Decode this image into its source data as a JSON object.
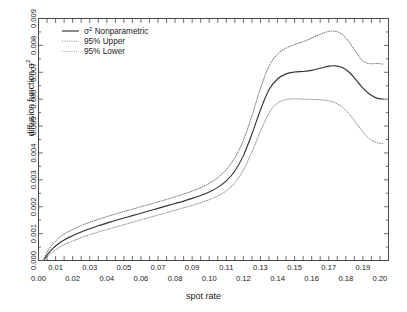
{
  "chart_data": {
    "type": "line",
    "title": "",
    "xlabel": "spot rate",
    "ylabel": "diffusion function σ²",
    "xlim": [
      0.0,
      0.205
    ],
    "ylim": [
      0.0,
      0.009
    ],
    "grid": false,
    "legend_position": "top-left",
    "x_ticklabels_upper": [
      "0.01",
      "0.03",
      "0.05",
      "0.07",
      "0.09",
      "0.11",
      "0.13",
      "0.15",
      "0.17",
      "0.19"
    ],
    "x_tickvalues_upper": [
      0.01,
      0.03,
      0.05,
      0.07,
      0.09,
      0.11,
      0.13,
      0.15,
      0.17,
      0.19
    ],
    "x_ticklabels_lower": [
      "0.00",
      "0.02",
      "0.04",
      "0.06",
      "0.08",
      "0.10",
      "0.12",
      "0.14",
      "0.16",
      "0.18",
      "0.20"
    ],
    "x_tickvalues_lower": [
      0.0,
      0.02,
      0.04,
      0.06,
      0.08,
      0.1,
      0.12,
      0.14,
      0.16,
      0.18,
      0.2
    ],
    "y_ticklabels": [
      "0.000",
      "0.001",
      "0.002",
      "0.003",
      "0.004",
      "0.005",
      "0.006",
      "0.007",
      "0.008",
      "0.009"
    ],
    "y_tickvalues": [
      0.0,
      0.001,
      0.002,
      0.003,
      0.004,
      0.005,
      0.006,
      0.007,
      0.008,
      0.009
    ],
    "x": [
      0.003,
      0.005,
      0.008,
      0.012,
      0.016,
      0.02,
      0.025,
      0.03,
      0.035,
      0.04,
      0.045,
      0.05,
      0.055,
      0.06,
      0.065,
      0.07,
      0.075,
      0.08,
      0.085,
      0.09,
      0.095,
      0.1,
      0.105,
      0.11,
      0.115,
      0.12,
      0.125,
      0.13,
      0.135,
      0.14,
      0.145,
      0.15,
      0.155,
      0.16,
      0.165,
      0.17,
      0.174,
      0.178,
      0.182,
      0.186,
      0.19,
      0.194,
      0.198,
      0.202
    ],
    "series": [
      {
        "name": "σ² Nonparametric",
        "style": "solid",
        "color": "#333333",
        "values": [
          0.0,
          0.0002,
          0.00042,
          0.00064,
          0.0008,
          0.00092,
          0.00106,
          0.00118,
          0.00129,
          0.00139,
          0.00149,
          0.00158,
          0.00167,
          0.00176,
          0.00185,
          0.00194,
          0.00203,
          0.00212,
          0.00221,
          0.00231,
          0.00242,
          0.00255,
          0.00272,
          0.00296,
          0.00333,
          0.0039,
          0.0047,
          0.0056,
          0.00635,
          0.00675,
          0.00694,
          0.00701,
          0.00703,
          0.00707,
          0.00715,
          0.00723,
          0.00724,
          0.00718,
          0.007,
          0.00672,
          0.00641,
          0.00618,
          0.00604,
          0.006
        ]
      },
      {
        "name": "95% Upper",
        "style": "dotted",
        "color": "#666666",
        "values": [
          0.0,
          0.0003,
          0.00058,
          0.00084,
          0.00102,
          0.00115,
          0.0013,
          0.00142,
          0.00153,
          0.00163,
          0.00173,
          0.00182,
          0.00191,
          0.002,
          0.00209,
          0.00218,
          0.00227,
          0.00237,
          0.00247,
          0.00258,
          0.00271,
          0.00287,
          0.00308,
          0.00338,
          0.00382,
          0.00447,
          0.00538,
          0.0064,
          0.00722,
          0.00768,
          0.0079,
          0.00803,
          0.00814,
          0.00827,
          0.00841,
          0.00852,
          0.00852,
          0.0084,
          0.00812,
          0.00775,
          0.00742,
          0.00732,
          0.00733,
          0.0073
        ]
      },
      {
        "name": "95% Lower",
        "style": "dotted",
        "color": "#808080",
        "values": [
          0.0,
          0.00013,
          0.0003,
          0.00048,
          0.00062,
          0.00072,
          0.00085,
          0.00096,
          0.00106,
          0.00115,
          0.00124,
          0.00133,
          0.00142,
          0.00151,
          0.0016,
          0.00169,
          0.00178,
          0.00187,
          0.00196,
          0.00205,
          0.00215,
          0.00226,
          0.0024,
          0.00259,
          0.00289,
          0.00337,
          0.00404,
          0.0048,
          0.00548,
          0.00585,
          0.00598,
          0.00601,
          0.006,
          0.00599,
          0.00598,
          0.00594,
          0.00586,
          0.0057,
          0.00545,
          0.00512,
          0.00478,
          0.00452,
          0.00438,
          0.00435
        ]
      }
    ]
  },
  "legend": {
    "items": [
      {
        "label": "σ² Nonparametric",
        "style": "solid"
      },
      {
        "label": "95% Upper",
        "style": "dotted"
      },
      {
        "label": "95% Lower",
        "style": "dotted"
      }
    ]
  },
  "axes": {
    "x_title": "spot rate",
    "y_title_prefix": "diffusion function ",
    "y_title_symbol": "σ",
    "y_title_exp": "2"
  }
}
